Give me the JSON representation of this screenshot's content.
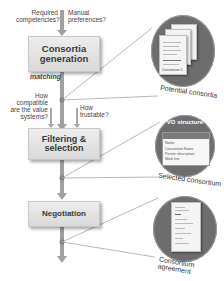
{
  "stages": [
    {
      "label": "Consortia generation"
    },
    {
      "label": "Filtering & selection"
    },
    {
      "label": "Negotiation"
    }
  ],
  "annotations": {
    "matching": "matching",
    "required_competencies": "Required competencies?",
    "manual_preferences": "Manual preferences?",
    "value_systems": "How compatible are the value systems?",
    "trustable": "How trustable?"
  },
  "outputs": [
    {
      "caption": "Potential consortia",
      "doc_label": "Consortium 1"
    },
    {
      "caption": "Selected consortium",
      "title": "VO structure",
      "rows": [
        "Name",
        "Consortium Name",
        "Partner description",
        "Work line"
      ]
    },
    {
      "caption": "Consortium agreement"
    }
  ],
  "colors": {
    "box_fill": "#e3e3e3",
    "arrow": "#9e9e9e",
    "circle": "#6d6d6d",
    "line": "#888888"
  }
}
